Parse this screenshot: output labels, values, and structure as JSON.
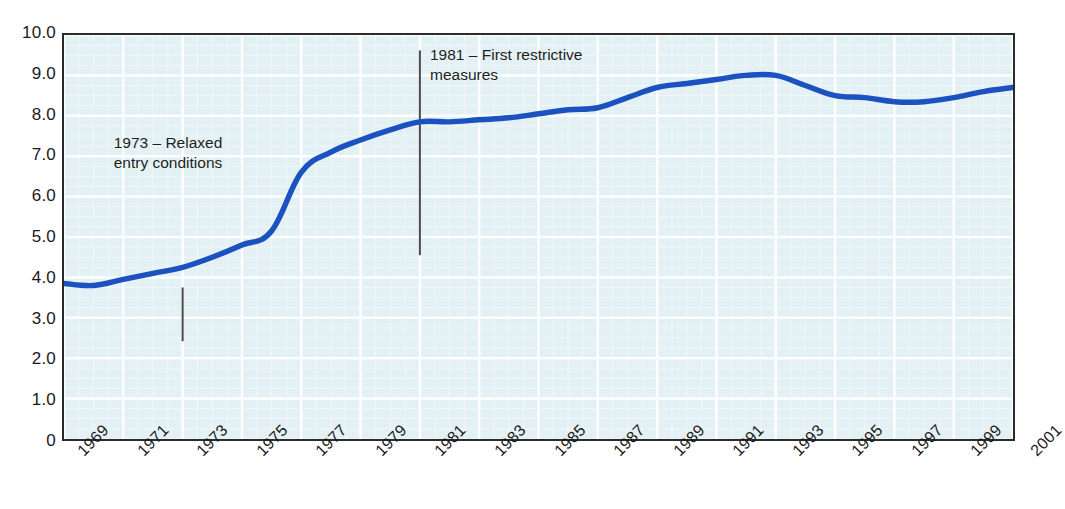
{
  "chart_data": {
    "type": "line",
    "title": "",
    "subtitle": "",
    "xlabel": "",
    "ylabel": "",
    "xlim": [
      1969,
      2001
    ],
    "ylim": [
      0,
      10
    ],
    "grid": true,
    "legend": "none",
    "line_color": "#1b52c0",
    "plot_background": "#e4f1f4",
    "axis_color": "#2b2b2b",
    "x": [
      1969,
      1970,
      1971,
      1972,
      1973,
      1974,
      1975,
      1976,
      1977,
      1978,
      1979,
      1980,
      1981,
      1982,
      1983,
      1984,
      1985,
      1986,
      1987,
      1988,
      1989,
      1990,
      1991,
      1992,
      1993,
      1994,
      1995,
      1996,
      1997,
      1998,
      1999,
      2000,
      2001
    ],
    "series": [
      {
        "name": "value",
        "values": [
          3.85,
          3.8,
          3.95,
          4.1,
          4.25,
          4.5,
          4.8,
          5.15,
          6.6,
          7.1,
          7.4,
          7.65,
          7.85,
          7.85,
          7.9,
          7.95,
          8.05,
          8.15,
          8.2,
          8.45,
          8.7,
          8.8,
          8.9,
          9.0,
          9.0,
          8.75,
          8.5,
          8.45,
          8.35,
          8.35,
          8.45,
          8.6,
          8.7
        ]
      }
    ],
    "y_ticks": [
      "0",
      "1.0",
      "2.0",
      "3.0",
      "4.0",
      "5.0",
      "6.0",
      "7.0",
      "8.0",
      "9.0",
      "10.0"
    ],
    "y_tick_values": [
      0,
      1,
      2,
      3,
      4,
      5,
      6,
      7,
      8,
      9,
      10
    ],
    "x_ticks": [
      "1969",
      "1971",
      "1973",
      "1975",
      "1977",
      "1979",
      "1981",
      "1983",
      "1985",
      "1987",
      "1989",
      "1991",
      "1993",
      "1995",
      "1997",
      "1999",
      "2001"
    ],
    "x_tick_values": [
      1969,
      1971,
      1973,
      1975,
      1977,
      1979,
      1981,
      1983,
      1985,
      1987,
      1989,
      1991,
      1993,
      1995,
      1997,
      1999,
      2001
    ],
    "annotations": [
      {
        "id": "1973",
        "text": "1973 – Relaxed\nentry conditions",
        "x_value": 1973,
        "marker_line_top": 3.75,
        "marker_line_bottom": 2.42,
        "marker_color": "#4a4a4a"
      },
      {
        "id": "1981",
        "text": "1981 – First restrictive\nmeasures",
        "x_value": 1981,
        "marker_line_top": 9.62,
        "marker_line_bottom": 4.55,
        "marker_color": "#4a4a4a"
      }
    ]
  }
}
